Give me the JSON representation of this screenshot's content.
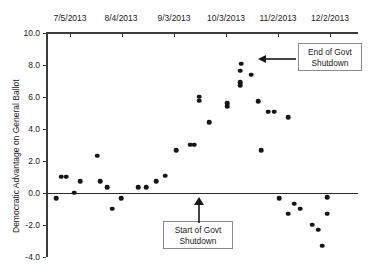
{
  "chart_data": {
    "type": "scatter",
    "title": "",
    "xlabel": "",
    "ylabel": "Democratic Advantage on General Ballot",
    "xlim": [
      "6/20/2013",
      "12/17/2013"
    ],
    "ylim": [
      -4.0,
      10.0
    ],
    "grid": false,
    "legend": "none",
    "x_tick_labels": [
      "7/5/2013",
      "8/4/2013",
      "9/3/2013",
      "10/3/2013",
      "11/2/2013",
      "12/2/2013"
    ],
    "y_tick_labels": [
      "10.0",
      "8.0",
      "6.0",
      "4.0",
      "2.0",
      "0.0",
      "-2.0",
      "-4.0"
    ],
    "y_tick_values": [
      10.0,
      8.0,
      6.0,
      4.0,
      2.0,
      0.0,
      -2.0,
      -4.0
    ],
    "x_axis_position": "top",
    "zero_reference_line": 0.0,
    "marker_color": "#161616",
    "axis_color": "#3b3b3b",
    "points": [
      {
        "x": 56,
        "y": -0.35
      },
      {
        "x": 61,
        "y": 1.0
      },
      {
        "x": 66,
        "y": 1.0
      },
      {
        "x": 74,
        "y": 0.0
      },
      {
        "x": 80,
        "y": 0.7
      },
      {
        "x": 97,
        "y": 2.3
      },
      {
        "x": 100,
        "y": 0.7
      },
      {
        "x": 107,
        "y": 0.35
      },
      {
        "x": 112,
        "y": -1.0
      },
      {
        "x": 121,
        "y": -0.35
      },
      {
        "x": 138,
        "y": 0.35
      },
      {
        "x": 146,
        "y": 0.35
      },
      {
        "x": 156,
        "y": 0.7
      },
      {
        "x": 165,
        "y": 1.05
      },
      {
        "x": 176,
        "y": 2.65
      },
      {
        "x": 190,
        "y": 3.0
      },
      {
        "x": 194,
        "y": 3.0
      },
      {
        "x": 199,
        "y": 6.0
      },
      {
        "x": 199,
        "y": 5.75
      },
      {
        "x": 209,
        "y": 4.4
      },
      {
        "x": 227,
        "y": 5.6
      },
      {
        "x": 227,
        "y": 5.4
      },
      {
        "x": 240,
        "y": 7.6
      },
      {
        "x": 241,
        "y": 8.05
      },
      {
        "x": 240,
        "y": 6.9
      },
      {
        "x": 240,
        "y": 6.7
      },
      {
        "x": 251,
        "y": 7.35
      },
      {
        "x": 258,
        "y": 5.7
      },
      {
        "x": 268,
        "y": 5.05
      },
      {
        "x": 274,
        "y": 5.05
      },
      {
        "x": 261,
        "y": 2.65
      },
      {
        "x": 288,
        "y": 4.7
      },
      {
        "x": 279,
        "y": -0.35
      },
      {
        "x": 288,
        "y": -1.3
      },
      {
        "x": 294,
        "y": -0.7
      },
      {
        "x": 300,
        "y": -1.0
      },
      {
        "x": 312,
        "y": -2.0
      },
      {
        "x": 318,
        "y": -2.3
      },
      {
        "x": 327,
        "y": -0.3
      },
      {
        "x": 327,
        "y": -1.3
      },
      {
        "x": 322,
        "y": -3.3
      }
    ],
    "annotations": [
      {
        "id": "end-of-shutdown",
        "text_line1": "End of Govt",
        "text_line2": "Shutdown",
        "arrow": "left"
      },
      {
        "id": "start-of-shutdown",
        "text_line1": "Start of Govt",
        "text_line2": "Shutdown",
        "arrow": "up"
      }
    ]
  }
}
